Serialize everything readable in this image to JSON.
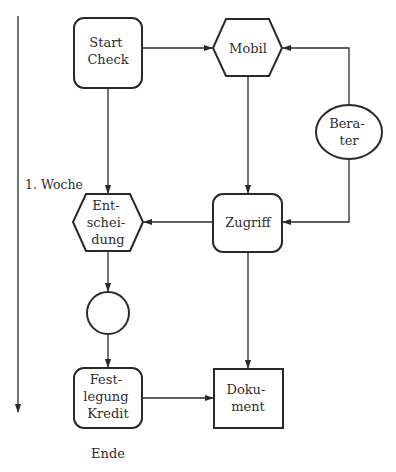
{
  "diagram": {
    "type": "flowchart",
    "colors": {
      "stroke": "#2a2a2a",
      "text": "#2e2e2e",
      "background": "#ffffff"
    },
    "timeline": {
      "label": "1. Woche",
      "end_label": "Ende",
      "direction": "down"
    },
    "nodes": {
      "start_check": {
        "shape": "rounded-rectangle",
        "lines": [
          "Start",
          "Check"
        ]
      },
      "mobil": {
        "shape": "hexagon",
        "lines": [
          "Mobil"
        ]
      },
      "berater": {
        "shape": "ellipse",
        "lines": [
          "Bera-",
          "ter"
        ]
      },
      "zugriff": {
        "shape": "rounded-rectangle",
        "lines": [
          "Zugriff"
        ]
      },
      "entscheidung": {
        "shape": "hexagon",
        "lines": [
          "Ent-",
          "schei-",
          "dung"
        ]
      },
      "connector": {
        "shape": "circle",
        "lines": []
      },
      "festlegung_kredit": {
        "shape": "rounded-rectangle",
        "lines": [
          "Fest-",
          "legung",
          "Kredit"
        ]
      },
      "dokument": {
        "shape": "rectangle",
        "lines": [
          "Doku-",
          "ment"
        ]
      }
    },
    "edges": [
      {
        "from": "Start Check",
        "to": "Mobil"
      },
      {
        "from": "Start Check",
        "to": "Entscheidung"
      },
      {
        "from": "Berater",
        "to": "Mobil"
      },
      {
        "from": "Berater",
        "to": "Zugriff"
      },
      {
        "from": "Mobil",
        "to": "Zugriff"
      },
      {
        "from": "Zugriff",
        "to": "Entscheidung"
      },
      {
        "from": "Zugriff",
        "to": "Dokument"
      },
      {
        "from": "Entscheidung",
        "to": "Connector"
      },
      {
        "from": "Connector",
        "to": "Festlegung Kredit"
      },
      {
        "from": "Festlegung Kredit",
        "to": "Dokument"
      }
    ]
  }
}
